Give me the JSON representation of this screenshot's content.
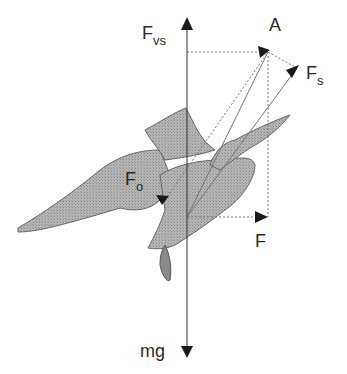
{
  "figure": {
    "labels": {
      "A": "A",
      "Fvs_main": "F",
      "Fvs_sub": "vs",
      "Fs_main": "F",
      "Fs_sub": "s",
      "Fo_main": "F",
      "Fo_sub": "o",
      "F": "F",
      "mg": "mg"
    },
    "colors": {
      "bird_fill": "#a9a9a9",
      "bird_stroke": "#555555",
      "arrow": "#1a1a1a",
      "guide": "#777777"
    }
  }
}
